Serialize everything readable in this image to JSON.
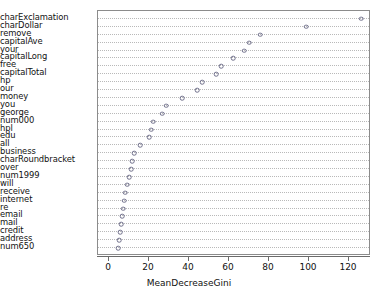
{
  "chart_data": {
    "type": "scatter",
    "subtype": "dotchart",
    "title": "",
    "xlabel": "MeanDecreaseGini",
    "ylabel": "",
    "xlim": [
      0,
      132
    ],
    "xticks": [
      0,
      20,
      40,
      60,
      80,
      100,
      120
    ],
    "grid": "horizontal-dotted",
    "legend": "none",
    "marker": "open-circle",
    "categories": [
      "charExclamation",
      "charDollar",
      "remove",
      "capitalAve",
      "your",
      "capitalLong",
      "free",
      "capitalTotal",
      "hp",
      "our",
      "money",
      "you",
      "george",
      "num000",
      "hpl",
      "edu",
      "all",
      "business",
      "charRoundbracket",
      "over",
      "num1999",
      "will",
      "receive",
      "internet",
      "re",
      "email",
      "mail",
      "credit",
      "address",
      "num650"
    ],
    "values": [
      126.0,
      98.5,
      75.5,
      70.0,
      67.5,
      62.0,
      56.0,
      53.5,
      46.5,
      44.0,
      36.5,
      28.5,
      26.5,
      22.0,
      21.0,
      20.0,
      15.5,
      12.5,
      11.5,
      11.0,
      10.0,
      9.0,
      8.0,
      7.5,
      7.0,
      6.5,
      6.0,
      5.5,
      5.0,
      4.5
    ]
  },
  "axis": {
    "tick_labels": [
      "0",
      "20",
      "40",
      "60",
      "80",
      "100",
      "120"
    ],
    "x_title": "MeanDecreaseGini"
  }
}
